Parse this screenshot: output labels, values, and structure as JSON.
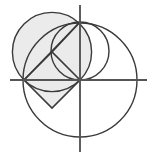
{
  "figure": {
    "canvas": {
      "width": 155,
      "height": 158,
      "background": "#ffffff"
    },
    "colors": {
      "stroke": "#3a3a3a",
      "axis": "#555555",
      "shaded_fill": "#ebebeb",
      "background": "#ffffff"
    },
    "stroke_widths": {
      "circle": 1.4,
      "axis": 1.9,
      "segment": 1.6
    }
  },
  "chart_data": {
    "type": "diagram",
    "origin": {
      "x": 80,
      "y": 80
    },
    "axes": {
      "x_axis": {
        "x1": 10,
        "y1": 80,
        "x2": 147,
        "y2": 80,
        "label": "x-axis"
      },
      "y_axis": {
        "x1": 80,
        "y1": 5,
        "x2": 80,
        "y2": 152,
        "label": "y-axis"
      },
      "grid": false,
      "tick_labels": []
    },
    "circles": [
      {
        "name": "large-circle",
        "cx": 80,
        "cy": 80,
        "r": 57,
        "filled": false,
        "description": "Large circle centred on the origin"
      },
      {
        "name": "shaded-circle",
        "cx": 52,
        "cy": 52,
        "r": 39.6,
        "filled": true,
        "description": "Shaded circle through the origin, through (24,80) and through (80,22)"
      },
      {
        "name": "medium-circle",
        "cx": 80,
        "cy": 51,
        "r": 29,
        "filled": false,
        "description": "Circle on the y-axis between the origin and (80,22)"
      }
    ],
    "polygon": {
      "name": "inscribed-square",
      "vertices": [
        {
          "x": 24,
          "y": 80
        },
        {
          "x": 52,
          "y": 52
        },
        {
          "x": 80,
          "y": 80
        },
        {
          "x": 52,
          "y": 108
        }
      ],
      "filled": true,
      "description": "Square (diamond orientation) with one vertex at the origin"
    },
    "segments": [
      {
        "name": "diagonal-chord",
        "x1": 24,
        "y1": 80,
        "x2": 80,
        "y2": 22,
        "description": "Chord from (24,80) to (80,22)"
      },
      {
        "name": "radius-to-top",
        "x1": 52,
        "y1": 52,
        "x2": 80,
        "y2": 22,
        "description": "Segment from square vertex to (80,22)"
      }
    ],
    "key_points": [
      {
        "name": "origin",
        "x": 80,
        "y": 80
      },
      {
        "name": "left-intersection",
        "x": 24,
        "y": 80
      },
      {
        "name": "top-intersection",
        "x": 80,
        "y": 22
      },
      {
        "name": "square-apex",
        "x": 52,
        "y": 52
      },
      {
        "name": "square-bottom",
        "x": 52,
        "y": 108
      }
    ],
    "legend": [],
    "annotations": []
  }
}
